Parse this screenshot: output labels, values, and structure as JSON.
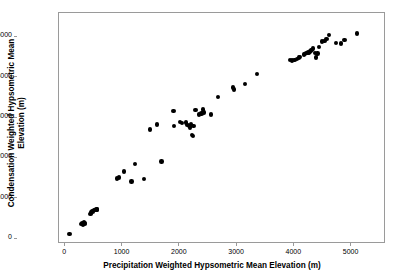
{
  "chart_data": {
    "type": "scatter",
    "title": "",
    "xlabel": "Precipitation Weighted Hypsometric Mean Elevation (m)",
    "ylabel_line1": "Condensation Weighted Hypsometric Mean",
    "ylabel_line2": "Elevation (m)",
    "ylabel": "Condensation Weighted Hypsometric Mean Elevation (m)",
    "xlim": [
      -110,
      5600
    ],
    "ylim": [
      -120,
      5600
    ],
    "xticks": [
      0,
      1000,
      2000,
      3000,
      4000,
      5000
    ],
    "yticks": [
      0,
      1000,
      2000,
      3000,
      4000,
      5000
    ],
    "xticklabels": [
      "0",
      "1000",
      "2000",
      "3000",
      "4000",
      "5000"
    ],
    "yticklabels": [
      "0",
      "1000",
      "2000",
      "3000",
      "4000",
      "5000"
    ],
    "grid": false,
    "legend": null,
    "marker": "filled-circle",
    "marker_color": "#000000",
    "marker_size_px": 4.4,
    "frame_color": "#9a9a9a",
    "background": "#ffffff",
    "n_points": 74,
    "points": [
      [
        90,
        105
      ],
      [
        300,
        345
      ],
      [
        320,
        370
      ],
      [
        330,
        330
      ],
      [
        340,
        400
      ],
      [
        350,
        380
      ],
      [
        355,
        355
      ],
      [
        455,
        595
      ],
      [
        470,
        640
      ],
      [
        490,
        660
      ],
      [
        505,
        680
      ],
      [
        520,
        700
      ],
      [
        540,
        700
      ],
      [
        560,
        705
      ],
      [
        575,
        710
      ],
      [
        920,
        1480
      ],
      [
        960,
        1500
      ],
      [
        1045,
        1655
      ],
      [
        1175,
        1405
      ],
      [
        1230,
        1835
      ],
      [
        1390,
        1465
      ],
      [
        1500,
        2690
      ],
      [
        1620,
        2810
      ],
      [
        1700,
        1900
      ],
      [
        1905,
        3150
      ],
      [
        1920,
        2780
      ],
      [
        2015,
        2880
      ],
      [
        2050,
        2845
      ],
      [
        2120,
        2860
      ],
      [
        2150,
        2805
      ],
      [
        2175,
        2770
      ],
      [
        2195,
        2745
      ],
      [
        2215,
        2810
      ],
      [
        2230,
        2555
      ],
      [
        2245,
        2530
      ],
      [
        2255,
        2780
      ],
      [
        2290,
        3175
      ],
      [
        2350,
        3060
      ],
      [
        2395,
        3085
      ],
      [
        2420,
        3185
      ],
      [
        2440,
        3115
      ],
      [
        2565,
        3060
      ],
      [
        2680,
        3500
      ],
      [
        2945,
        3730
      ],
      [
        2965,
        3680
      ],
      [
        3155,
        3815
      ],
      [
        3360,
        4070
      ],
      [
        3945,
        4405
      ],
      [
        3975,
        4400
      ],
      [
        4020,
        4415
      ],
      [
        4060,
        4440
      ],
      [
        4095,
        4470
      ],
      [
        4120,
        4490
      ],
      [
        4185,
        4550
      ],
      [
        4205,
        4560
      ],
      [
        4230,
        4590
      ],
      [
        4255,
        4600
      ],
      [
        4275,
        4580
      ],
      [
        4290,
        4625
      ],
      [
        4310,
        4650
      ],
      [
        4330,
        4660
      ],
      [
        4340,
        4700
      ],
      [
        4375,
        4590
      ],
      [
        4390,
        4470
      ],
      [
        4420,
        4575
      ],
      [
        4450,
        4740
      ],
      [
        4500,
        4870
      ],
      [
        4545,
        4885
      ],
      [
        4580,
        4925
      ],
      [
        4625,
        5035
      ],
      [
        4745,
        4830
      ],
      [
        4830,
        4825
      ],
      [
        4890,
        4905
      ],
      [
        5110,
        5065
      ]
    ]
  }
}
